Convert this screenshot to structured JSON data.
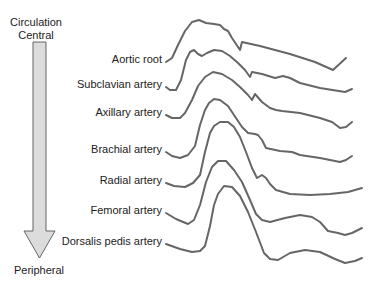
{
  "diagram": {
    "title_lines": [
      "Circulation",
      "Central"
    ],
    "bottom_label": "Peripheral",
    "arrow": {
      "direction": "down",
      "fill": "#dcdcdc",
      "stroke": "#555555"
    },
    "waveform_color": "#666666",
    "waveforms": [
      {
        "label": "Aortic root",
        "label_y": 62,
        "points": "166,62 172,58 178,45 185,31 192,22 199,20 206,23 214,24 220,25 224,29 228,31 232,38 236,44 240,50 242,42 260,46 290,54 315,62 333,70 346,58"
      },
      {
        "label": "Subclavian artery",
        "label_y": 87,
        "points": "166,87 170,90 176,90 181,80 186,60 190,52 194,50 198,54 202,56 207,53 214,50 222,51 230,56 238,63 245,70 250,77 252,72 262,74 275,78 283,76 290,78 300,83 320,88 345,92 352,89"
      },
      {
        "label": "Axillary artery",
        "label_y": 115,
        "points": "166,115 172,118 180,118 185,113 192,100 198,86 205,77 213,72 222,74 232,80 240,87 248,95 252,100 255,94 262,102 270,108 276,110 282,111 300,113 320,118 332,122 340,128 346,127 352,122"
      },
      {
        "label": "Brachial artery",
        "label_y": 152,
        "points": "166,152 172,156 180,158 188,155 195,146 200,125 205,110 209,103 214,99 220,100 228,106 236,118 242,127 248,133 255,134 258,135 262,140 266,148 280,151 292,152 300,155 320,158 340,162 346,160 352,156"
      },
      {
        "label": "Radial artery",
        "label_y": 183,
        "points": "166,183 174,186 185,187 193,183 200,175 205,152 210,133 214,126 220,122 228,122 234,127 240,137 246,152 252,168 257,178 262,175 266,178 270,184 276,190 290,194 310,195 330,194 348,192 362,188"
      },
      {
        "label": "Femoral artery",
        "label_y": 213,
        "points": "166,213 176,219 188,224 194,220 200,205 206,182 212,167 218,161 226,161 234,170 242,182 250,200 256,214 262,220 270,222 285,218 300,215 312,217 320,222 328,231 338,233 345,235 352,233 362,228"
      },
      {
        "label": "Dorsalis pedis artery",
        "label_y": 244,
        "points": "166,244 180,249 192,252 200,251 205,246 210,226 214,205 218,194 224,186 232,187 240,196 248,212 256,232 264,253 270,259 278,260 290,253 305,250 320,252 335,259 345,263 355,261 362,258"
      }
    ]
  }
}
